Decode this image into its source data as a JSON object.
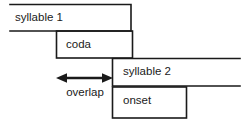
{
  "diagram": {
    "stroke_color": "#1a1a1a",
    "background_color": "#ffffff",
    "boxes": [
      {
        "id": "syllable-1",
        "label": "syllable 1",
        "x": 10,
        "y": 4,
        "width": 121,
        "height": 27,
        "open_side": "left"
      },
      {
        "id": "coda",
        "label": "coda",
        "x": 56,
        "y": 31,
        "width": 76,
        "height": 27,
        "open_side": "none"
      },
      {
        "id": "syllable-2",
        "label": "syllable 2",
        "x": 112,
        "y": 58,
        "width": 128,
        "height": 28,
        "open_side": "right"
      },
      {
        "id": "onset",
        "label": "onset",
        "x": 112,
        "y": 87,
        "width": 74,
        "height": 31,
        "open_side": "none"
      }
    ],
    "annotation": {
      "id": "overlap",
      "label": "overlap",
      "arrow": {
        "type": "double-headed",
        "x1": 57,
        "x2": 112,
        "y": 78
      }
    }
  }
}
